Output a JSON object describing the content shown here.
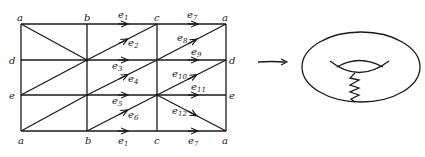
{
  "figure": {
    "grid": {
      "columns_x": [
        21,
        87,
        157,
        226
      ],
      "rows_y": [
        24,
        60,
        95,
        131
      ],
      "top_labels": [
        "a",
        "b",
        "c",
        "a"
      ],
      "bottom_labels": [
        "a",
        "b",
        "c",
        "a"
      ],
      "left_labels": [
        "a",
        "d",
        "e",
        "a"
      ],
      "right_labels": [
        "a",
        "d",
        "e",
        "a"
      ]
    },
    "edges": [
      {
        "name": "e",
        "sub": "1",
        "where": "top row b-c"
      },
      {
        "name": "e",
        "sub": "2",
        "where": "diagonal b-c row 1"
      },
      {
        "name": "e",
        "sub": "3",
        "where": "d-line b-c"
      },
      {
        "name": "e",
        "sub": "4",
        "where": "diagonal b-c row 2"
      },
      {
        "name": "e",
        "sub": "5",
        "where": "e-line b-c"
      },
      {
        "name": "e",
        "sub": "6",
        "where": "diagonal b-c row 3"
      },
      {
        "name": "e",
        "sub": "7",
        "where": "top row c-a"
      },
      {
        "name": "e",
        "sub": "8",
        "where": "diagonal c-a row 1"
      },
      {
        "name": "e",
        "sub": "9",
        "where": "d-line c-d"
      },
      {
        "name": "e",
        "sub": "10",
        "where": "diagonal c-a row 2"
      },
      {
        "name": "e",
        "sub": "11",
        "where": "e-line c-e"
      },
      {
        "name": "e",
        "sub": "12",
        "where": "diagonal c-a row 3 (descending)"
      },
      {
        "name": "e",
        "sub": "1",
        "where": "bottom row b-c"
      },
      {
        "name": "e",
        "sub": "7",
        "where": "bottom row c-a"
      }
    ],
    "map_arrow": "right-arrow",
    "result": "torus-with-zigzag-cut"
  }
}
